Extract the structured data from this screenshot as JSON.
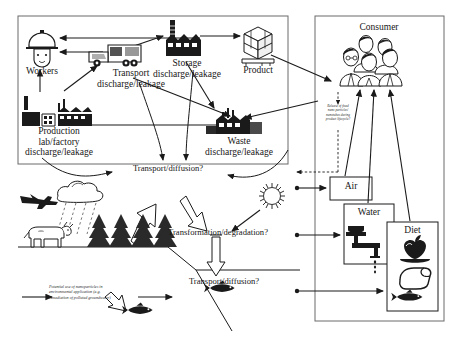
{
  "figure": {
    "type": "life-cycle-flow-diagram"
  },
  "panels": {
    "industrial": {
      "name": "industrial-panel"
    },
    "consumer": {
      "name": "consumer-panel",
      "title": "Consumer"
    }
  },
  "nodes": {
    "workers": {
      "label": "Workers",
      "icon": "worker-helmet-icon"
    },
    "production": {
      "label": "Production\nlab/factory\ndischarge/leakage",
      "icon": "factory-icon"
    },
    "transport": {
      "label": "Transport\ndischarge/leakage",
      "icon": "truck-icon"
    },
    "storage": {
      "label": "Storage\ndischarge/leakage",
      "icon": "warehouse-icon"
    },
    "product": {
      "label": "Product",
      "icon": "product-box-icon"
    },
    "waste": {
      "label": "Waste\ndischarge/leakage",
      "icon": "waste-plant-icon"
    },
    "consumer": {
      "label": "Consumer",
      "icon": "people-group-icon"
    },
    "air": {
      "label": "Air"
    },
    "water": {
      "label": "Water",
      "icon": "faucet-icon"
    },
    "diet": {
      "label": "Diet",
      "icon": "food-icon"
    }
  },
  "process_labels": {
    "transport_diffusion_air": "Transport/diffusion?",
    "transformation_degradation": "Transformation/degradation?",
    "transport_diffusion_water": "Transport/diffusion?"
  },
  "annotations": {
    "release_note": "Release of fixed\nnano particles/\nnanotubes during\nproduct lifecycle?",
    "remediation_note": "Potential use of nanoparticles in\nenvironmental application (e.g.\nremediation of polluted groundwater)"
  },
  "scene_icons": [
    {
      "name": "airplane-icon"
    },
    {
      "name": "rain-cloud-icon"
    },
    {
      "name": "cow-icon"
    },
    {
      "name": "pine-tree-icon"
    },
    {
      "name": "sun-icon"
    },
    {
      "name": "fish-icon"
    },
    {
      "name": "apple-icon"
    },
    {
      "name": "bread-icon"
    }
  ],
  "colors": {
    "stroke": "#1a1a1a",
    "background": "#ffffff",
    "panel_border": "#555555",
    "hollow_arrow_fill": "#ffffff"
  }
}
